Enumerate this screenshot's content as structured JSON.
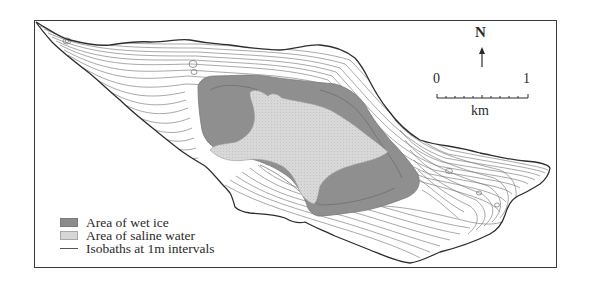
{
  "map": {
    "north_label": "N",
    "scale": {
      "start_label": "0",
      "end_label": "1",
      "unit_label": "km",
      "ticks": 10
    },
    "legend": [
      {
        "label": "Area of wet ice",
        "swatch": "wet-ice",
        "color": "#8c8c8c"
      },
      {
        "label": "Area of saline water",
        "swatch": "saline-water",
        "color": "#d6d6d6"
      },
      {
        "label": "Isobaths at 1m intervals",
        "swatch": "line",
        "color": "#555555"
      }
    ],
    "colors": {
      "outline": "#2e2e2e",
      "isobath": "#6a6a6a",
      "wet_ice": "#8c8c8c",
      "saline_water": "#d6d6d6",
      "background": "#ffffff"
    }
  }
}
